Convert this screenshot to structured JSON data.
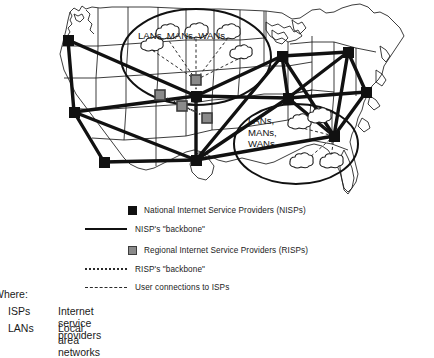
{
  "figure": {
    "type": "network-topology-map",
    "region": "United States",
    "callouts": [
      {
        "id": "west-callout",
        "label": "LANs, MANs, WANs",
        "lines": [
          "LANs, MANs, WANs"
        ],
        "hub_type": "RISP",
        "cloud_count": 5
      },
      {
        "id": "east-callout",
        "label": "LANs, MANs, WANs",
        "lines": [
          "LANs,",
          "MANs,",
          "WANs"
        ],
        "hub_type": "NISP",
        "cloud_count": 4
      }
    ]
  },
  "legend": {
    "items": [
      {
        "marker": "nisp-square",
        "kind": "box",
        "label": "National Internet Service Providers (NISPs)"
      },
      {
        "marker": "solid-line",
        "kind": "line",
        "label": "NISP's \"backbone\""
      },
      {
        "marker": "risp-square",
        "kind": "box",
        "label": "Regional Internet Service Providers (RISPs)"
      },
      {
        "marker": "dotted-line",
        "kind": "line",
        "label": "RISP's \"backbone\""
      },
      {
        "marker": "dashed-line",
        "kind": "line",
        "label": "User connections to ISPs"
      }
    ]
  },
  "glossary": {
    "heading": "Where:",
    "entries": [
      {
        "term": "ISPs",
        "definition": "Internet service providers"
      },
      {
        "term": "LANs",
        "definition": "Local area networks"
      }
    ]
  },
  "colors": {
    "nisp": "#111111",
    "risp_fill": "#8a8a8a",
    "risp_border": "#3d3d3d",
    "map_outline": "#1a1a1a",
    "background": "#ffffff"
  }
}
